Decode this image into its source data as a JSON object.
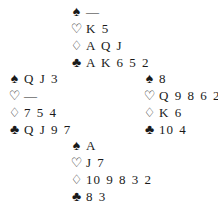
{
  "suits": {
    "spades": "♠",
    "hearts": "♡",
    "diamonds": "♢",
    "clubs": "♣"
  },
  "hands": {
    "north": {
      "spades": "—",
      "hearts": "K 5",
      "diamonds": "A Q J",
      "clubs": "A K 6 5 2"
    },
    "west": {
      "spades": "Q J 3",
      "hearts": "—",
      "diamonds": "7 5 4",
      "clubs": "Q J 9 7"
    },
    "east": {
      "spades": "8",
      "hearts": "Q 9 8 6 2",
      "diamonds": "K 6",
      "clubs": "10 4"
    },
    "south": {
      "spades": "A",
      "hearts": "J 7",
      "diamonds": "10 9 8 3 2",
      "clubs": "8 3"
    }
  }
}
